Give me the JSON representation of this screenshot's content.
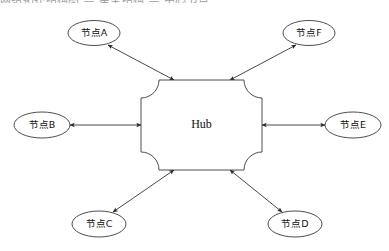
{
  "page": {
    "cut_off_top_text": "网络拓扑结构图 — 星型结构 — 中心节点",
    "background_color": "#ffffff",
    "line_color": "#4a4a4a",
    "shape_fill": "#ffffff",
    "shape_stroke": "#3a3a3a"
  },
  "diagram": {
    "type": "star-topology",
    "hub": {
      "label": "Hub",
      "shape": "concave-corner-rectangle",
      "x": 201.5,
      "y": 125,
      "width": 121,
      "height": 90,
      "corner_radius": 18
    },
    "nodes": [
      {
        "id": "A",
        "label": "节点A",
        "cx": 94,
        "cy": 33,
        "rx": 26,
        "ry": 12.5,
        "position": "top-left"
      },
      {
        "id": "F",
        "label": "节点F",
        "cx": 309,
        "cy": 33,
        "rx": 26,
        "ry": 12.5,
        "position": "top-right"
      },
      {
        "id": "B",
        "label": "节点B",
        "cx": 42,
        "cy": 125,
        "rx": 28,
        "ry": 13,
        "position": "left"
      },
      {
        "id": "E",
        "label": "节点E",
        "cx": 353,
        "cy": 125,
        "rx": 28,
        "ry": 13,
        "position": "right"
      },
      {
        "id": "C",
        "label": "节点C",
        "cx": 99,
        "cy": 224,
        "rx": 27,
        "ry": 13,
        "position": "bottom-left"
      },
      {
        "id": "D",
        "label": "节点D",
        "cx": 295,
        "cy": 224,
        "rx": 27,
        "ry": 13,
        "position": "bottom-right"
      }
    ],
    "edges": [
      {
        "id": "edge-hub-a",
        "from": "Hub",
        "to": "节点A",
        "direction": "bidirectional",
        "x1": 174,
        "y1": 80,
        "x2": 108,
        "y2": 45
      },
      {
        "id": "edge-hub-f",
        "from": "Hub",
        "to": "节点F",
        "direction": "bidirectional",
        "x1": 230,
        "y1": 80,
        "x2": 296,
        "y2": 45
      },
      {
        "id": "edge-hub-b",
        "from": "Hub",
        "to": "节点B",
        "direction": "bidirectional",
        "x1": 141,
        "y1": 125,
        "x2": 70,
        "y2": 125
      },
      {
        "id": "edge-hub-e",
        "from": "Hub",
        "to": "节点E",
        "direction": "bidirectional",
        "x1": 262,
        "y1": 125,
        "x2": 325,
        "y2": 125
      },
      {
        "id": "edge-hub-c",
        "from": "Hub",
        "to": "节点C",
        "direction": "bidirectional",
        "x1": 174,
        "y1": 170,
        "x2": 113,
        "y2": 212
      },
      {
        "id": "edge-hub-d",
        "from": "Hub",
        "to": "节点D",
        "direction": "bidirectional",
        "x1": 230,
        "y1": 170,
        "x2": 282,
        "y2": 212
      }
    ]
  }
}
